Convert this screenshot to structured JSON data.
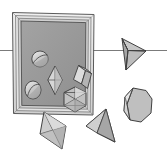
{
  "illustration": {
    "title": "Geometric solids arranged around a picture frame",
    "width": 167,
    "height": 153,
    "background_color": "#ffffff",
    "style": "grayscale pencil and wash drawing",
    "caption": ""
  },
  "palette": {
    "background": "#ffffff",
    "frame_outer": "#e9e9e9",
    "frame_mid": "#d2d2d2",
    "frame_inner_bevel": "#bdbdbd",
    "frame_interior": "#9a9a9a",
    "frame_interior_shade": "#8e8e8e",
    "outline": "#3a3a3a",
    "outline_soft": "#5a5a5a",
    "solid_light": "#d8d8d8",
    "solid_mid": "#b9b9b9",
    "solid_dark": "#9c9c9c",
    "solid_darker": "#868686",
    "horizon_line": "#777777"
  },
  "frame": {
    "name": "picture-frame",
    "x": 12,
    "y": 12,
    "width": 82,
    "height": 103,
    "border_width": 6,
    "interior_fill": "#9a9a9a"
  },
  "horizon": {
    "name": "horizontal-reference-line",
    "y": 50,
    "x_start": 0,
    "x_end": 167,
    "color": "#777777",
    "stroke_width": 1
  },
  "solids": [
    {
      "id": "sphere-upper",
      "label": "Sphere with great circle",
      "shape": "sphere",
      "location": "inside-frame",
      "cx": 40,
      "cy": 59,
      "rx": 8,
      "ry": 8,
      "fill": "#c9c9c9"
    },
    {
      "id": "bipyramid-diamond",
      "label": "Rhombic bipyramid",
      "shape": "octahedron",
      "location": "inside-frame",
      "cx": 55,
      "cy": 80,
      "half_width": 7,
      "half_height": 14,
      "fill": "#d2d2d2"
    },
    {
      "id": "sphere-lower",
      "label": "Sphere with great circle",
      "shape": "sphere",
      "location": "inside-frame",
      "cx": 33,
      "cy": 90,
      "rx": 8,
      "ry": 9,
      "fill": "#c4c4c4"
    },
    {
      "id": "parallelepiped",
      "label": "Tilted rectangular prism",
      "shape": "parallelepiped",
      "location": "overlapping-frame-edge",
      "cx": 82,
      "cy": 78,
      "fill": "#d4d4d4"
    },
    {
      "id": "triangulated-hexagon",
      "label": "Triangulated hexagonal solid",
      "shape": "hexagonal-antiprism",
      "location": "overlapping-frame-edge",
      "cx": 75,
      "cy": 100,
      "radius": 13,
      "fill": "#bdbdbd"
    },
    {
      "id": "tetrahedron-right",
      "label": "Tetrahedron pointing right",
      "shape": "tetrahedron",
      "location": "on-horizon-line",
      "cx": 134,
      "cy": 50,
      "fill": "#b4b4b4"
    },
    {
      "id": "octagonal-prism",
      "label": "Octagonal prism",
      "shape": "octagonal-prism",
      "location": "outside-frame-right",
      "cx": 137,
      "cy": 105,
      "fill": "#bcbcbc"
    },
    {
      "id": "octahedron-lower-left",
      "label": "Elongated octahedron",
      "shape": "octahedron",
      "location": "outside-frame-bottom-left",
      "cx": 53,
      "cy": 132,
      "fill": "#c6c6c6"
    },
    {
      "id": "cone-tetrahedron",
      "label": "Tetrahedron / cone",
      "shape": "tetrahedron",
      "location": "outside-frame-bottom",
      "cx": 102,
      "cy": 128,
      "fill": "#b0b0b0"
    }
  ]
}
